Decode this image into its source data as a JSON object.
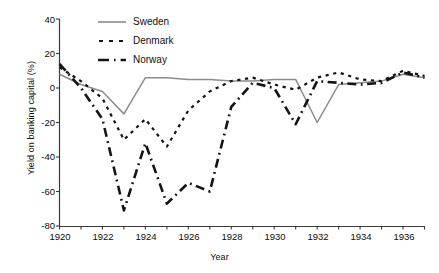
{
  "chart_data": {
    "type": "line",
    "title": "",
    "xlabel": "Year",
    "ylabel": "Yield on banking capital (%)",
    "xlim": [
      1920,
      1937
    ],
    "ylim": [
      -80,
      40
    ],
    "xticks": [
      1920,
      1921,
      1922,
      1923,
      1924,
      1925,
      1926,
      1927,
      1928,
      1929,
      1930,
      1931,
      1932,
      1933,
      1934,
      1935,
      1936,
      1937
    ],
    "xticklabels": [
      "1920",
      "",
      "1922",
      "",
      "1924",
      "",
      "1926",
      "",
      "1928",
      "",
      "1930",
      "",
      "1932",
      "",
      "1934",
      "",
      "1936",
      ""
    ],
    "xticklabels_shown": [
      "1920",
      "1922",
      "1924",
      "1926",
      "1928",
      "1930",
      "1932",
      "1934",
      "1936"
    ],
    "yticks": [
      40,
      20,
      0,
      -20,
      -40,
      -60,
      -80
    ],
    "yticklabels": [
      "40",
      "20",
      "0",
      "-20",
      "-40",
      "-60",
      "-80"
    ],
    "grid": false,
    "legend_position": "top-center",
    "x": [
      1920,
      1921,
      1922,
      1923,
      1924,
      1925,
      1926,
      1927,
      1928,
      1929,
      1930,
      1931,
      1932,
      1933,
      1934,
      1935,
      1936,
      1937
    ],
    "series": [
      {
        "name": "Sweden",
        "color": "#8c8c8c",
        "style": "solid",
        "values": [
          8,
          2,
          -2,
          -15,
          6,
          6,
          5,
          5,
          4,
          4,
          5,
          5,
          -20,
          2,
          3,
          4,
          8,
          6
        ]
      },
      {
        "name": "Denmark",
        "color": "#141414",
        "style": "dotted",
        "values": [
          12,
          4,
          -6,
          -30,
          -18,
          -34,
          -13,
          -2,
          4,
          6,
          2,
          -1,
          6,
          9,
          5,
          4,
          10,
          7
        ]
      },
      {
        "name": "Norway",
        "color": "#141414",
        "style": "dashed",
        "values": [
          14,
          0,
          -18,
          -71,
          -32,
          -67,
          -55,
          -60,
          -11,
          3,
          0,
          -21,
          4,
          3,
          2,
          3,
          9,
          6
        ]
      }
    ]
  },
  "legend": {
    "items": [
      {
        "label": "Sweden",
        "style": "solid",
        "color": "#8c8c8c"
      },
      {
        "label": "Denmark",
        "style": "dotted",
        "color": "#141414"
      },
      {
        "label": "Norway",
        "style": "dashed",
        "color": "#141414"
      }
    ]
  },
  "axes": {
    "ylabel": "Yield on banking capital (%)",
    "xlabel": "Year"
  }
}
